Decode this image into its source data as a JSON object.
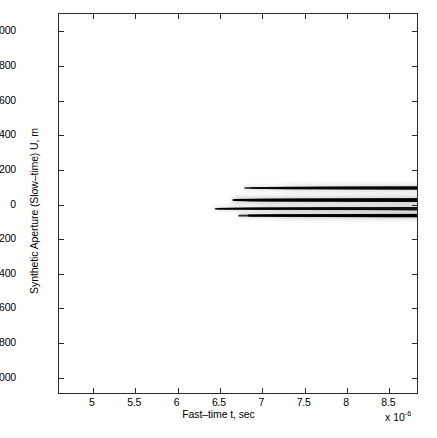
{
  "figure": {
    "background": "#ffffff",
    "frame_color": "#2b2b2b",
    "caption": ""
  },
  "axes": {
    "x_title": "Fast–time t, sec",
    "x_exponent_prefix": "x 10",
    "x_exponent_power": "-6",
    "y_title": "Synthetic Aperture (Slow–time) U, m"
  },
  "chart_data": {
    "type": "scatter",
    "title": "",
    "subtitle": "",
    "xlabel": "Fast–time t, sec",
    "ylabel": "Synthetic Aperture (Slow–time) U, m",
    "x_scale_factor": "1e-6",
    "xlim": [
      4.6,
      8.85
    ],
    "ylim": [
      -1100,
      1100
    ],
    "xticks": [
      5,
      5.5,
      6,
      6.5,
      7,
      7.5,
      8,
      8.5
    ],
    "xticklabels": [
      "5",
      "5.5",
      "6",
      "6.5",
      "7",
      "7.5",
      "8",
      "8.5"
    ],
    "yticks": [
      1000,
      800,
      600,
      400,
      200,
      0,
      -200,
      -400,
      -600,
      -800,
      -1000
    ],
    "yticklabels": [
      "1000",
      "800",
      "600",
      "400",
      "200",
      "0",
      "-200",
      "-400",
      "-600",
      "-800",
      "-1000"
    ],
    "grid": false,
    "legend": "none",
    "colormap": "grayscale",
    "series": [
      {
        "name": "target-1",
        "apex_t": 6.45,
        "apex_u": -30,
        "curvature": 1.25e-06,
        "intensity": 0.92,
        "u_min": -640,
        "u_max": 560,
        "thickness": 1.5
      },
      {
        "name": "target-2",
        "apex_t": 6.66,
        "apex_u": 20,
        "curvature": 1.28e-06,
        "intensity": 1.0,
        "u_min": -660,
        "u_max": 600,
        "thickness": 2.0
      },
      {
        "name": "target-3",
        "apex_t": 6.73,
        "apex_u": -70,
        "curvature": 1.3e-06,
        "intensity": 0.95,
        "u_min": -650,
        "u_max": 610,
        "thickness": 1.8
      },
      {
        "name": "target-4",
        "apex_t": 6.8,
        "apex_u": 90,
        "curvature": 1.32e-06,
        "intensity": 0.85,
        "u_min": -620,
        "u_max": 620,
        "thickness": 1.6
      }
    ],
    "sidelobes": {
      "enabled": true,
      "orientation": "horizontal",
      "center_u_range": [
        -220,
        230
      ],
      "t_range": [
        5.95,
        7.35
      ],
      "intensity": 0.16
    }
  }
}
